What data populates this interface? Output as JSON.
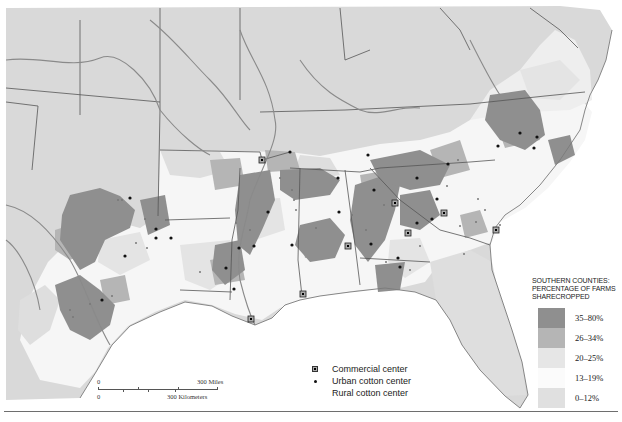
{
  "map": {
    "subject": "Southern United States counties — sharecropping",
    "colors": {
      "ocean": "#ffffff",
      "nonsouth_land": "#d9d9d9",
      "state_border": "#555555",
      "river": "#8a8a8a",
      "class_35_80": "#8f8f8f",
      "class_26_34": "#b5b5b5",
      "class_20_25": "#e4e4e4",
      "class_13_19": "#f8f8f8",
      "class_0_12": "#dedede"
    }
  },
  "legend": {
    "title_line1": "SOUTHERN COUNTIES:",
    "title_line2": "PERCENTAGE OF FARMS",
    "title_line3": "SHARECROPPED",
    "classes": [
      {
        "label": "35–80%",
        "color": "#8f8f8f"
      },
      {
        "label": "26–34%",
        "color": "#b5b5b5"
      },
      {
        "label": "20–25%",
        "color": "#e6e6e6"
      },
      {
        "label": "13–19%",
        "color": "#fbfbfb"
      },
      {
        "label": "0–12%",
        "color": "#e0e0e0"
      }
    ]
  },
  "symbols": {
    "commercial": "Commercial center",
    "urban": "Urban cotton center",
    "rural": "Rural cotton center"
  },
  "scale": {
    "zero_top": "0",
    "zero_bottom": "0",
    "miles": "300 Miles",
    "km": "300 Kilometers"
  }
}
